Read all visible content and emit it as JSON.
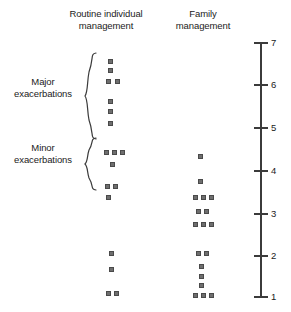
{
  "chart_data": {
    "type": "scatter",
    "title": "",
    "xlabel": "",
    "ylabel": "",
    "ylim": [
      1,
      7
    ],
    "grid": false,
    "legend_position": "none",
    "axis": {
      "orientation": "vertical",
      "side": "right",
      "ticks": [
        7,
        6,
        5,
        4,
        3,
        2,
        1
      ],
      "tick_labels": [
        "7",
        "6",
        "5",
        "4",
        "3",
        "2",
        "1"
      ]
    },
    "categories": [
      "Routine individual management",
      "Family management"
    ],
    "group_annotations": [
      {
        "label": "Major exacerbations",
        "line1": "Major",
        "line2": "exacerbations",
        "y_range": [
          4.6,
          6.7
        ]
      },
      {
        "label": "Minor exacerbations",
        "line1": "Minor",
        "line2": "exacerbations",
        "y_range": [
          3.8,
          4.6
        ]
      }
    ],
    "series": [
      {
        "name": "Routine individual management",
        "points": [
          {
            "value": 6.7,
            "count": 1
          },
          {
            "value": 6.5,
            "count": 1
          },
          {
            "value": 6.2,
            "count": 2
          },
          {
            "value": 5.6,
            "count": 1
          },
          {
            "value": 5.4,
            "count": 1
          },
          {
            "value": 5.1,
            "count": 1
          },
          {
            "value": 4.4,
            "count": 3
          },
          {
            "value": 4.1,
            "count": 1
          },
          {
            "value": 3.6,
            "count": 2
          },
          {
            "value": 3.4,
            "count": 1
          },
          {
            "value": 2.1,
            "count": 1
          },
          {
            "value": 1.8,
            "count": 1
          },
          {
            "value": 1.2,
            "count": 2
          }
        ]
      },
      {
        "name": "Family management",
        "points": [
          {
            "value": 4.4,
            "count": 1
          },
          {
            "value": 3.8,
            "count": 1
          },
          {
            "value": 3.4,
            "count": 3
          },
          {
            "value": 3.1,
            "count": 2
          },
          {
            "value": 2.8,
            "count": 3
          },
          {
            "value": 2.1,
            "count": 2
          },
          {
            "value": 1.8,
            "count": 1
          },
          {
            "value": 1.5,
            "count": 1
          },
          {
            "value": 1.3,
            "count": 1
          },
          {
            "value": 1.1,
            "count": 3
          }
        ]
      }
    ],
    "marker_color": "#6e6e6e",
    "axis_color": "#3b3b3b",
    "text_color": "#1b1b1b"
  },
  "headers": {
    "routine_line1": "Routine individual",
    "routine_line2": "management",
    "family_line1": "Family",
    "family_line2": "management"
  },
  "labels": {
    "major_line1": "Major",
    "major_line2": "exacerbations",
    "minor_line1": "Minor",
    "minor_line2": "exacerbations"
  },
  "axis_tick_labels": [
    "7",
    "6",
    "5",
    "4",
    "3",
    "2",
    "1"
  ],
  "marker_layout": {
    "col1_x_centers": [
      110,
      118,
      126
    ],
    "col2_x_centers": [
      201,
      209,
      217
    ],
    "col1_rows": [
      {
        "y": 61,
        "xs": [
          110
        ]
      },
      {
        "y": 70,
        "xs": [
          110
        ]
      },
      {
        "y": 81,
        "xs": [
          108,
          117
        ]
      },
      {
        "y": 101,
        "xs": [
          110
        ]
      },
      {
        "y": 111,
        "xs": [
          110
        ]
      },
      {
        "y": 123,
        "xs": [
          110
        ]
      },
      {
        "y": 152,
        "xs": [
          106,
          114,
          122
        ]
      },
      {
        "y": 164,
        "xs": [
          112
        ]
      },
      {
        "y": 186,
        "xs": [
          107,
          115
        ]
      },
      {
        "y": 197,
        "xs": [
          108
        ]
      },
      {
        "y": 253,
        "xs": [
          111
        ]
      },
      {
        "y": 269,
        "xs": [
          111
        ]
      },
      {
        "y": 293,
        "xs": [
          108,
          116
        ]
      }
    ],
    "col2_rows": [
      {
        "y": 156,
        "xs": [
          200
        ]
      },
      {
        "y": 181,
        "xs": [
          200
        ]
      },
      {
        "y": 197,
        "xs": [
          195,
          203,
          211
        ]
      },
      {
        "y": 211,
        "xs": [
          198,
          206
        ]
      },
      {
        "y": 224,
        "xs": [
          195,
          203,
          211
        ]
      },
      {
        "y": 253,
        "xs": [
          198,
          206
        ]
      },
      {
        "y": 266,
        "xs": [
          201
        ]
      },
      {
        "y": 276,
        "xs": [
          201
        ]
      },
      {
        "y": 285,
        "xs": [
          201
        ]
      },
      {
        "y": 295,
        "xs": [
          195,
          203,
          211
        ]
      }
    ]
  },
  "axis_geometry": {
    "tick_y": [
      12,
      54,
      97,
      140,
      183,
      225,
      266
    ]
  }
}
